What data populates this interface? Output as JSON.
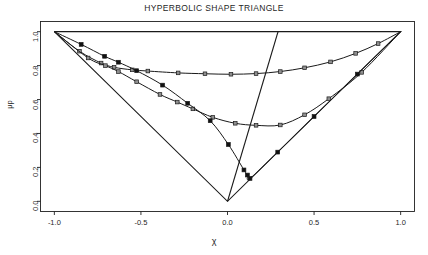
{
  "chart_data": {
    "type": "line",
    "title": "HYPERBOLIC SHAPE TRIANGLE",
    "xlabel": "χ",
    "ylabel": "μp",
    "xlim": [
      -1.08,
      1.08
    ],
    "ylim": [
      -0.06,
      1.06
    ],
    "xticks": [
      "-1.0",
      "-0.5",
      "0.0",
      "0.5",
      "1.0"
    ],
    "xtick_values": [
      -1.0,
      -0.5,
      0.0,
      0.5,
      1.0
    ],
    "yticks": [
      "0.0",
      "0.2",
      "0.4",
      "0.6",
      "0.8",
      "1.0"
    ],
    "ytick_values": [
      0.0,
      0.2,
      0.4,
      0.6,
      0.8,
      1.0
    ],
    "grid": false,
    "legend": "none",
    "frame": "box",
    "boundary": {
      "name": "shape-triangle-boundary",
      "points": [
        [
          -1.0,
          1.0
        ],
        [
          1.0,
          1.0
        ],
        [
          0.0,
          0.0
        ],
        [
          -1.0,
          1.0
        ]
      ]
    },
    "reference_line": {
      "name": "steep-reference-line",
      "points": [
        [
          0.0,
          0.0
        ],
        [
          0.292,
          1.0
        ]
      ]
    },
    "series": [
      {
        "name": "upper-curve",
        "marker": "open-square",
        "points": [
          [
            -1.0,
            1.0
          ],
          [
            -0.855,
            0.885
          ],
          [
            -0.73,
            0.815
          ],
          [
            -0.655,
            0.79
          ],
          [
            -0.55,
            0.775
          ],
          [
            -0.46,
            0.768
          ],
          [
            -0.285,
            0.757
          ],
          [
            -0.13,
            0.752
          ],
          [
            0.02,
            0.749
          ],
          [
            0.165,
            0.753
          ],
          [
            0.305,
            0.765
          ],
          [
            0.445,
            0.787
          ],
          [
            0.595,
            0.822
          ],
          [
            0.74,
            0.872
          ],
          [
            0.87,
            0.93
          ],
          [
            1.0,
            1.0
          ]
        ]
      },
      {
        "name": "middle-curve",
        "marker": "open-square",
        "points": [
          [
            -1.0,
            1.0
          ],
          [
            -0.805,
            0.845
          ],
          [
            -0.705,
            0.8
          ],
          [
            -0.63,
            0.765
          ],
          [
            -0.525,
            0.705
          ],
          [
            -0.39,
            0.63
          ],
          [
            -0.29,
            0.585
          ],
          [
            -0.2,
            0.545
          ],
          [
            -0.085,
            0.495
          ],
          [
            0.045,
            0.46
          ],
          [
            0.165,
            0.448
          ],
          [
            0.305,
            0.45
          ],
          [
            0.445,
            0.51
          ],
          [
            0.585,
            0.605
          ],
          [
            0.775,
            0.76
          ],
          [
            1.0,
            1.0
          ]
        ]
      },
      {
        "name": "lower-curve",
        "marker": "filled-square",
        "points": [
          [
            -1.0,
            1.0
          ],
          [
            -0.845,
            0.925
          ],
          [
            -0.71,
            0.855
          ],
          [
            -0.63,
            0.82
          ],
          [
            -0.525,
            0.77
          ],
          [
            -0.375,
            0.685
          ],
          [
            -0.23,
            0.578
          ],
          [
            -0.1,
            0.475
          ],
          [
            0.005,
            0.335
          ],
          [
            0.095,
            0.185
          ],
          [
            0.115,
            0.155
          ],
          [
            0.13,
            0.135
          ],
          [
            0.29,
            0.29
          ],
          [
            0.5,
            0.5
          ],
          [
            0.75,
            0.75
          ],
          [
            1.0,
            1.0
          ]
        ]
      }
    ]
  },
  "colors": {
    "axis": "#1f1f1f",
    "curve": "#1a1a1a",
    "marker_open_fill": "#8f8f8f",
    "marker_filled": "#111111",
    "background": "#ffffff"
  }
}
